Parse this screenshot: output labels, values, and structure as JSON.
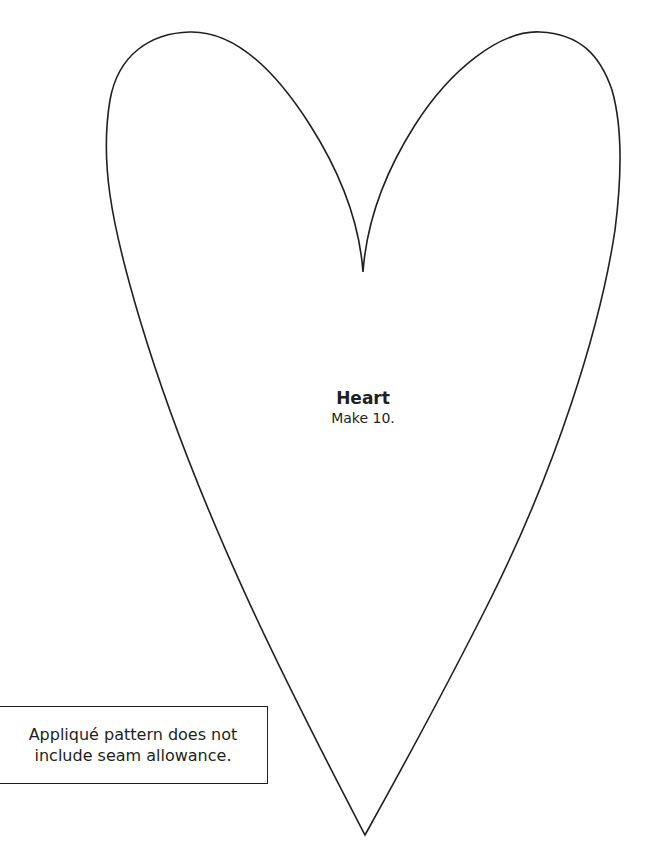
{
  "pattern": {
    "shape_name": "Heart",
    "quantity_text": "Make 10.",
    "outline_color": "#231f20",
    "outline_icon": "heart-outline-icon"
  },
  "note": {
    "lines": [
      "Appliqué pattern does not",
      "include seam allowance."
    ],
    "border_color": "#231f20"
  },
  "colors": {
    "background": "#ffffff",
    "ink": "#231f20"
  }
}
